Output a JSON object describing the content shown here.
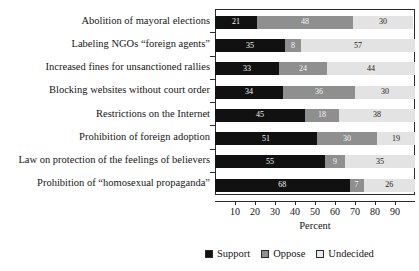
{
  "chart_data": {
    "type": "bar",
    "orientation": "horizontal",
    "stacked": true,
    "title": "",
    "xlabel": "Percent",
    "ylabel": "",
    "xlim": [
      0,
      100
    ],
    "xticks": [
      10,
      20,
      30,
      40,
      50,
      60,
      70,
      80,
      90
    ],
    "xticklabels": [
      "10",
      "20",
      "30",
      "40",
      "50",
      "60",
      "70",
      "80",
      "90"
    ],
    "grid": false,
    "legend_position": "bottom",
    "categories": [
      "Abolition of mayoral elections",
      "Labeling NGOs “foreign agents”",
      "Increased fines for unsanctioned rallies",
      "Blocking websites without court order",
      "Restrictions on the Internet",
      "Prohibition of foreign adoption",
      "Law on protection of the feelings of believers",
      "Prohibition of “homosexual propaganda”"
    ],
    "series": [
      {
        "name": "Support",
        "color": "#111111",
        "values": [
          21,
          35,
          32,
          34,
          45,
          51,
          55,
          68
        ]
      },
      {
        "name": "Oppose",
        "color": "#8f8f8f",
        "values": [
          48,
          8,
          24,
          36,
          17,
          30,
          10,
          7
        ]
      },
      {
        "name": "Undecided",
        "color": "#e3e3e3",
        "values": [
          30,
          57,
          44,
          30,
          38,
          19,
          35,
          26
        ]
      }
    ],
    "bar_labels": {
      "support": [
        "21",
        "35",
        "33",
        "34",
        "45",
        "51",
        "55",
        "68"
      ],
      "oppose": [
        "48",
        "8",
        "24",
        "36",
        "18",
        "30",
        "9",
        "7"
      ],
      "undecided": [
        "30",
        "57",
        "44",
        "30",
        "38",
        "19",
        "35",
        "26"
      ]
    }
  },
  "legend": {
    "items": [
      {
        "label": "Support",
        "color": "#111111"
      },
      {
        "label": "Oppose",
        "color": "#8f8f8f"
      },
      {
        "label": "Undecided",
        "color": "#e9e9e9"
      }
    ]
  }
}
